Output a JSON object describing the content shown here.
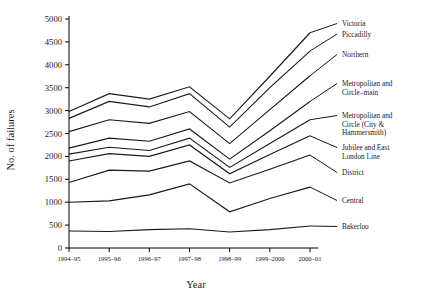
{
  "chart_data": {
    "type": "line",
    "title": "",
    "xlabel": "Year",
    "ylabel": "No. of failures",
    "categories": [
      "1994–95",
      "1995–96",
      "1996–97",
      "1997–98",
      "1998–99",
      "1999–2000",
      "2000–01"
    ],
    "ylim": [
      0,
      5000
    ],
    "ytick_values": [
      0,
      500,
      1000,
      1500,
      2000,
      2500,
      3000,
      3500,
      4000,
      4500,
      5000
    ],
    "ytick_labels": [
      "0",
      "500",
      "1000",
      "1500",
      "2000",
      "2500",
      "3000",
      "3500",
      "4000",
      "4500",
      "5000"
    ],
    "grid": false,
    "legend_position": "right-inline-labels",
    "series": [
      {
        "name": "Victoria",
        "label": "Victoria",
        "values": [
          2980,
          3370,
          3250,
          3520,
          2820,
          3750,
          4700
        ]
      },
      {
        "name": "Piccadilly",
        "label": "Piccadilly",
        "values": [
          2830,
          3200,
          3080,
          3370,
          2640,
          3500,
          4300
        ]
      },
      {
        "name": "Northern",
        "label": "Northern",
        "values": [
          2540,
          2800,
          2720,
          2980,
          2280,
          3020,
          3760
        ]
      },
      {
        "name": "Metropolitan and Circle-main",
        "label": "Metropolitan and Circle–main",
        "values": [
          2180,
          2400,
          2330,
          2600,
          1940,
          2560,
          3200
        ]
      },
      {
        "name": "Metropolitan and Circle (City & Hammersmith)",
        "label": "Metropolitan and Circle (City & Hammersmith)",
        "values": [
          2050,
          2200,
          2130,
          2400,
          1760,
          2280,
          2800
        ]
      },
      {
        "name": "Jubilee and East London Line",
        "label": "Jubilee and East London Line",
        "values": [
          1900,
          2060,
          2000,
          2250,
          1620,
          2040,
          2450
        ]
      },
      {
        "name": "District",
        "label": "District",
        "values": [
          1430,
          1700,
          1680,
          1900,
          1420,
          1720,
          2030
        ]
      },
      {
        "name": "Central",
        "label": "Central",
        "values": [
          1000,
          1030,
          1160,
          1400,
          790,
          1080,
          1330
        ]
      },
      {
        "name": "Bakerloo",
        "label": "Bakerloo",
        "values": [
          370,
          360,
          400,
          420,
          350,
          400,
          480
        ]
      }
    ],
    "legend_entries": [
      {
        "lines": [
          "Victoria"
        ]
      },
      {
        "lines": [
          "Piccadilly"
        ]
      },
      {
        "lines": [
          "Northern"
        ]
      },
      {
        "lines": [
          "Metropolitan and",
          "Circle–main"
        ]
      },
      {
        "lines": [
          "Metropolitan and",
          "Circle (City &",
          "Hammersmith)"
        ]
      },
      {
        "lines": [
          "Jubilee and East",
          "London Line"
        ]
      },
      {
        "lines": [
          "District"
        ]
      },
      {
        "lines": [
          "Central"
        ]
      },
      {
        "lines": [
          "Bakerloo"
        ]
      }
    ],
    "colors": {
      "line": "#1a1a1a",
      "axis": "#000000",
      "background": "#ffffff"
    }
  }
}
